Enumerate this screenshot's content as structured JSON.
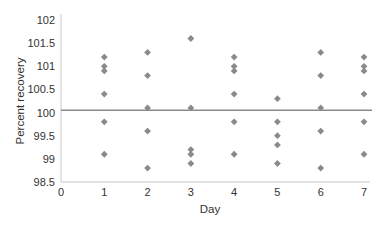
{
  "chart_data": {
    "type": "scatter",
    "title": "",
    "xlabel": "Day",
    "ylabel": "Percent recovery",
    "xlim": [
      0,
      7
    ],
    "ylim": [
      98.5,
      102
    ],
    "x_ticks": [
      "0",
      "1",
      "2",
      "3",
      "4",
      "5",
      "6",
      "7"
    ],
    "y_ticks": [
      "102",
      "101.5",
      "101",
      "100.5",
      "100",
      "99.5",
      "99",
      "98.5"
    ],
    "grid": false,
    "legend": null,
    "marker": "diamond",
    "marker_color": "#8a8a8a",
    "reference_line": {
      "y": 100.05,
      "color": "#8a8a8a",
      "label": ""
    },
    "series": [
      {
        "name": "Percent recovery",
        "points": [
          {
            "x": 1,
            "y": 101.2
          },
          {
            "x": 1,
            "y": 101.0
          },
          {
            "x": 1,
            "y": 100.9
          },
          {
            "x": 1,
            "y": 100.4
          },
          {
            "x": 1,
            "y": 99.8
          },
          {
            "x": 1,
            "y": 99.1
          },
          {
            "x": 2,
            "y": 101.3
          },
          {
            "x": 2,
            "y": 100.8
          },
          {
            "x": 2,
            "y": 100.1
          },
          {
            "x": 2,
            "y": 99.6
          },
          {
            "x": 2,
            "y": 98.8
          },
          {
            "x": 3,
            "y": 101.6
          },
          {
            "x": 3,
            "y": 100.1
          },
          {
            "x": 3,
            "y": 99.2
          },
          {
            "x": 3,
            "y": 99.1
          },
          {
            "x": 3,
            "y": 98.9
          },
          {
            "x": 4,
            "y": 101.2
          },
          {
            "x": 4,
            "y": 101.0
          },
          {
            "x": 4,
            "y": 100.9
          },
          {
            "x": 4,
            "y": 100.4
          },
          {
            "x": 4,
            "y": 99.8
          },
          {
            "x": 4,
            "y": 99.1
          },
          {
            "x": 5,
            "y": 100.3
          },
          {
            "x": 5,
            "y": 99.8
          },
          {
            "x": 5,
            "y": 99.5
          },
          {
            "x": 5,
            "y": 99.3
          },
          {
            "x": 5,
            "y": 98.9
          },
          {
            "x": 6,
            "y": 101.3
          },
          {
            "x": 6,
            "y": 100.8
          },
          {
            "x": 6,
            "y": 100.1
          },
          {
            "x": 6,
            "y": 99.6
          },
          {
            "x": 6,
            "y": 98.8
          },
          {
            "x": 7,
            "y": 101.2
          },
          {
            "x": 7,
            "y": 101.0
          },
          {
            "x": 7,
            "y": 100.9
          },
          {
            "x": 7,
            "y": 100.4
          },
          {
            "x": 7,
            "y": 99.8
          },
          {
            "x": 7,
            "y": 99.1
          }
        ]
      }
    ]
  }
}
